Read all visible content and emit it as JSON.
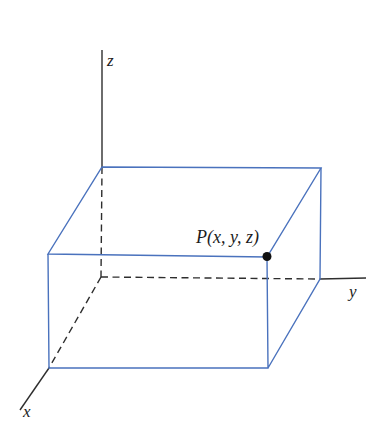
{
  "figure": {
    "labels": {
      "z_axis": "z",
      "y_axis": "y",
      "x_axis": "x",
      "point": "P(x, y, z)"
    },
    "colors": {
      "box": "#4a72bd",
      "axis": "#2e2e2e",
      "point": "#111111",
      "text": "#1c1c1c",
      "background": "#ffffff"
    }
  }
}
